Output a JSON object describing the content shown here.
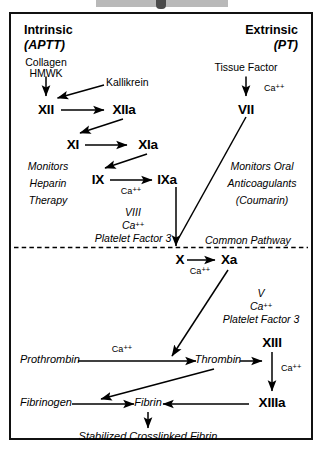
{
  "diagram": {
    "title_visible": false,
    "type": "coagulation-cascade",
    "frame_color": "#111111",
    "text_color": "#000000"
  },
  "pathways": {
    "intrinsic": {
      "heading": "Intrinsic",
      "test": "(APTT)",
      "initiators": [
        "Collagen",
        "HMWK"
      ],
      "activator": "Kallikrein",
      "monitor_note": [
        "Monitors",
        "Heparin",
        "Therapy"
      ]
    },
    "extrinsic": {
      "heading": "Extrinsic",
      "test": "(PT)",
      "initiator": "Tissue Factor",
      "monitor_note": [
        "Monitors Oral",
        "Anticoagulants",
        "(Coumarin)"
      ]
    },
    "common": {
      "divider_label": "Common Pathway"
    }
  },
  "factors": {
    "xii": "XII",
    "xiia": "XIIa",
    "xi": "XI",
    "xia": "XIa",
    "ix": "IX",
    "ixa": "IXa",
    "vii": "VII",
    "x": "X",
    "xa": "Xa",
    "xiii": "XIII",
    "xiiia": "XIIIa",
    "prothrombin": "Prothrombin",
    "thrombin": "Thrombin",
    "fibrinogen": "Fibrinogen",
    "fibrin": "Fibrin",
    "final_product": "Stabilized Crosslinked Fibrin"
  },
  "cofactors": {
    "calcium": "Ca",
    "calcium_charge": "++",
    "tenase": [
      "VIII",
      "Ca++",
      "Platelet Factor 3"
    ],
    "tenase_v": "VIII",
    "prothrombinase": [
      "V",
      "Ca++",
      "Platelet Factor 3"
    ],
    "prothrombinase_v": "V",
    "platelet_factor_3": "Platelet Factor 3"
  }
}
